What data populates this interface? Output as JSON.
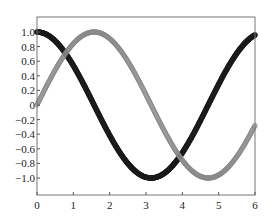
{
  "chart_data": {
    "type": "scatter",
    "title": "",
    "xlabel": "",
    "ylabel": "",
    "xlim": [
      0,
      6
    ],
    "ylim": [
      -1.15,
      1.15
    ],
    "grid": false,
    "legend": null,
    "x_ticks": [
      "0",
      "1",
      "2",
      "3",
      "4",
      "5",
      "6"
    ],
    "y_ticks": [
      "1.0",
      "0.8",
      "0.6",
      "0.4",
      "0.2",
      "0",
      "-0.2",
      "-0.4",
      "-0.6",
      "-0.8",
      "-1.0"
    ],
    "series": [
      {
        "name": "cos(x)",
        "marker": "filled-dense",
        "color": "#1a1a1a",
        "function": "cos",
        "x_range": [
          0,
          6
        ],
        "points": 400
      },
      {
        "name": "sin(x)",
        "marker": "open-circle",
        "color": "#888888",
        "function": "sin",
        "x_range": [
          0,
          6
        ],
        "points": 400
      }
    ]
  }
}
